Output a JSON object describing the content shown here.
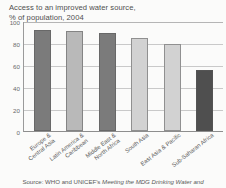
{
  "chart_data": {
    "type": "bar",
    "title": "Access to an improved water source,",
    "subtitle": "% of population, 2004",
    "xlabel": "",
    "ylabel": "",
    "ylim": [
      0,
      100
    ],
    "yticks": [
      "0",
      "20",
      "40",
      "60",
      "80",
      "100"
    ],
    "ytick_values": [
      0,
      20,
      40,
      60,
      80,
      100
    ],
    "grid": true,
    "legend": "none",
    "categories": [
      "Europe & Central Asia",
      "Latin America & Caribbean",
      "Middle East & North Africa",
      "South Asia",
      "East Asia & Pacific",
      "Sub-Saharan Africa"
    ],
    "category_lines": [
      [
        "Europe &",
        "Central Asia"
      ],
      [
        "Latin America &",
        "Caribbean"
      ],
      [
        "Middle East &",
        "North Africa"
      ],
      [
        "South Asia"
      ],
      [
        "East Asia & Pacific"
      ],
      [
        "Sub-Saharan Africa"
      ]
    ],
    "values": [
      93,
      92,
      90,
      85,
      80,
      56
    ],
    "bar_colors": [
      "#7b7b7b",
      "#b9b9b9",
      "#7b7b7b",
      "#d2d2d2",
      "#d2d2d2",
      "#4f4f4f"
    ]
  },
  "source": {
    "prefix": "Source: WHO and UNICEF's ",
    "italic": "Meeting the MDG Drinking Water and",
    "full": "Source: WHO and UNICEF's Meeting the MDG Drinking Water and"
  }
}
